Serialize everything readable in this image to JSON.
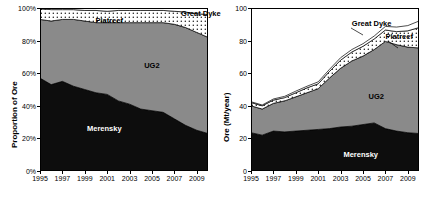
{
  "figure": {
    "panels": [
      "proportion",
      "absolute"
    ]
  },
  "chart_data": [
    {
      "type": "area",
      "id": "proportion-of-ore",
      "title": "",
      "xlabel": "",
      "ylabel": "Proportion of Ore",
      "stacked": true,
      "normalized": true,
      "grid": false,
      "legend_position": "inline-annotations",
      "xlim": [
        1995,
        2010
      ],
      "ylim": [
        0,
        100
      ],
      "yticks": [
        "0%",
        "20%",
        "40%",
        "60%",
        "80%",
        "100%"
      ],
      "ytick_values": [
        0,
        20,
        40,
        60,
        80,
        100
      ],
      "xticks": [
        "1995",
        "1997",
        "1999",
        "2001",
        "2003",
        "2005",
        "2007",
        "2009"
      ],
      "xtick_values": [
        1995,
        1997,
        1999,
        2001,
        2003,
        2005,
        2007,
        2009
      ],
      "x": [
        1995,
        1996,
        1997,
        1998,
        1999,
        2000,
        2001,
        2002,
        2003,
        2004,
        2005,
        2006,
        2007,
        2008,
        2009,
        2010
      ],
      "series": [
        {
          "name": "Merensky",
          "color": "#0d0d0d",
          "pattern": "solid",
          "values": [
            57,
            53,
            55,
            52,
            50,
            48,
            47,
            43,
            41,
            38,
            37,
            36,
            32,
            28,
            25,
            23
          ]
        },
        {
          "name": "UG2",
          "color": "#8a8a8a",
          "pattern": "solid",
          "values": [
            36,
            39,
            38,
            41,
            42,
            43,
            44,
            48,
            50,
            53,
            54,
            55,
            58,
            60,
            60,
            59
          ]
        },
        {
          "name": "Platreef",
          "color": "#ffffff",
          "pattern": "dotted",
          "values": [
            6.5,
            7.0,
            6.0,
            6.0,
            6.5,
            7.5,
            7.0,
            7.5,
            7.5,
            7.5,
            7.5,
            7.5,
            8.0,
            9.5,
            11.5,
            14.0
          ]
        },
        {
          "name": "Great Dyke",
          "color": "#ffffff",
          "pattern": "plain",
          "values": [
            0.5,
            1.0,
            1.0,
            1.0,
            1.5,
            1.5,
            2.0,
            1.5,
            1.5,
            1.5,
            1.5,
            1.5,
            2.0,
            2.5,
            3.5,
            4.0
          ]
        }
      ],
      "annotations": [
        {
          "text": "Merensky",
          "x_frac": 0.28,
          "y_frac": 0.72,
          "tone": "light"
        },
        {
          "text": "UG2",
          "x_frac": 0.62,
          "y_frac": 0.33,
          "tone": "dark"
        },
        {
          "text": "Platreef",
          "x_frac": 0.33,
          "y_frac": 0.055,
          "tone": "dark"
        },
        {
          "text": "Great Dyke",
          "x_frac": 0.84,
          "y_frac": 0.012,
          "tone": "dark"
        }
      ]
    },
    {
      "type": "area",
      "id": "ore-mt-per-year",
      "title": "",
      "xlabel": "",
      "ylabel": "Ore (Mt/year)",
      "stacked": true,
      "normalized": false,
      "grid": false,
      "legend_position": "inline-annotations",
      "xlim": [
        1995,
        2010
      ],
      "ylim": [
        0,
        100
      ],
      "yticks": [
        "0",
        "20",
        "40",
        "60",
        "80",
        "100"
      ],
      "ytick_values": [
        0,
        20,
        40,
        60,
        80,
        100
      ],
      "xticks": [
        "1995",
        "1997",
        "1999",
        "2001",
        "2003",
        "2005",
        "2007",
        "2009"
      ],
      "xtick_values": [
        1995,
        1997,
        1999,
        2001,
        2003,
        2005,
        2007,
        2009
      ],
      "x": [
        1995,
        1996,
        1997,
        1998,
        1999,
        2000,
        2001,
        2002,
        2003,
        2004,
        2005,
        2006,
        2007,
        2008,
        2009,
        2010
      ],
      "series": [
        {
          "name": "Merensky",
          "color": "#0d0d0d",
          "pattern": "solid",
          "values": [
            23.5,
            22.0,
            24.5,
            24.0,
            24.5,
            25.0,
            25.5,
            26.0,
            27.0,
            27.5,
            28.5,
            29.5,
            26.0,
            24.5,
            23.5,
            23.0
          ]
        },
        {
          "name": "UG2",
          "color": "#8a8a8a",
          "pattern": "solid",
          "values": [
            16.5,
            16.0,
            17.0,
            19.0,
            21.0,
            23.0,
            25.0,
            31.0,
            36.0,
            40.0,
            42.0,
            45.0,
            53.5,
            53.0,
            52.5,
            52.5
          ]
        },
        {
          "name": "Platreef",
          "color": "#ffffff",
          "pattern": "dotted",
          "values": [
            2.0,
            2.0,
            2.0,
            2.0,
            2.5,
            3.0,
            3.0,
            4.0,
            5.0,
            5.5,
            6.0,
            6.5,
            7.0,
            8.0,
            10.0,
            12.5
          ]
        },
        {
          "name": "Great Dyke",
          "color": "#ffffff",
          "pattern": "plain",
          "values": [
            0.5,
            0.5,
            0.7,
            0.8,
            1.0,
            1.0,
            1.2,
            1.3,
            1.5,
            1.5,
            1.6,
            1.8,
            2.2,
            2.8,
            3.2,
            4.0
          ]
        }
      ],
      "annotations": [
        {
          "text": "Merensky",
          "x_frac": 0.55,
          "y_frac": 0.88,
          "tone": "light"
        },
        {
          "text": "UG2",
          "x_frac": 0.7,
          "y_frac": 0.52,
          "tone": "dark"
        },
        {
          "text": "Platreef",
          "x_frac": 0.8,
          "y_frac": 0.155,
          "tone": "dark"
        },
        {
          "text": "Great Dyke",
          "x_frac": 0.6,
          "y_frac": 0.075,
          "tone": "dark"
        }
      ]
    }
  ]
}
